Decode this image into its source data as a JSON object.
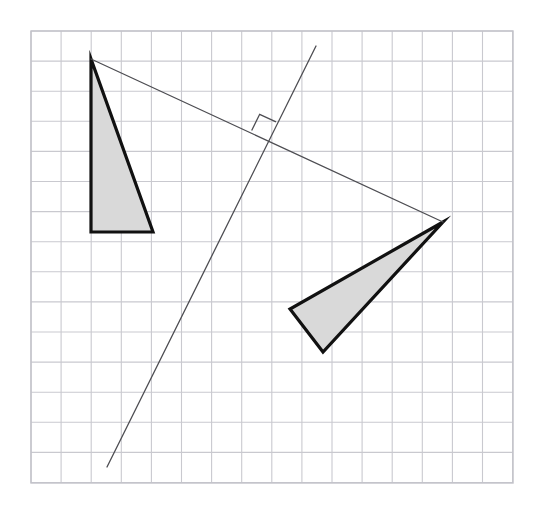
{
  "figure": {
    "title": "Rotation of a triangle about a point with perpendicular construction line",
    "canvas": {
      "width": 540,
      "height": 515,
      "background": "#ffffff"
    }
  },
  "grid": {
    "name": "graph-paper-grid",
    "origin_x": 31,
    "origin_y": 31,
    "cell_size": 30.1,
    "columns": 16,
    "rows": 15,
    "right_edge": 513,
    "bottom_edge": 483,
    "line_color": "#c9c9cf",
    "line_width": 1.1,
    "border_color": "#c2c2c9",
    "border_width": 1.4
  },
  "palette": {
    "shape_fill": "#d9d9d9",
    "shape_stroke": "#111111",
    "construction_stroke": "#4d4d52",
    "grid_line": "#c9c9cf",
    "background": "#ffffff"
  },
  "shapes": [
    {
      "name": "left-triangle",
      "label": "Pre-image triangle (upright, right angle at lower left)",
      "fill": "#d9d9d9",
      "stroke": "#111111",
      "stroke_width": 3.2,
      "vertices": [
        {
          "label": "A",
          "x": 91,
          "y": 59
        },
        {
          "label": "B",
          "x": 91,
          "y": 232
        },
        {
          "label": "C",
          "x": 153,
          "y": 232
        }
      ]
    },
    {
      "name": "right-triangle",
      "label": "Image triangle (rotated, narrow wedge)",
      "fill": "#d9d9d9",
      "stroke": "#111111",
      "stroke_width": 3.2,
      "vertices": [
        {
          "label": "A'",
          "x": 443,
          "y": 222
        },
        {
          "label": "B'",
          "x": 290,
          "y": 309
        },
        {
          "label": "C'",
          "x": 323,
          "y": 352
        }
      ]
    }
  ],
  "construction_lines": [
    {
      "name": "connector-segment",
      "label": "Segment joining corresponding vertices A and A'",
      "stroke": "#4d4d52",
      "stroke_width": 1.3,
      "x1": 91,
      "y1": 59,
      "x2": 443,
      "y2": 222
    },
    {
      "name": "perpendicular-bisector-line",
      "label": "Perpendicular construction line through the midpoint",
      "stroke": "#4d4d52",
      "stroke_width": 1.3,
      "x1": 316,
      "y1": 46,
      "x2": 107,
      "y2": 467
    }
  ],
  "markers": [
    {
      "name": "right-angle-marker",
      "label": "Right angle symbol at the intersection of the two construction lines",
      "stroke": "#4d4d52",
      "stroke_width": 1.3,
      "fill": "none",
      "intersection_x": 268,
      "intersection_y": 138,
      "size": 18
    }
  ]
}
